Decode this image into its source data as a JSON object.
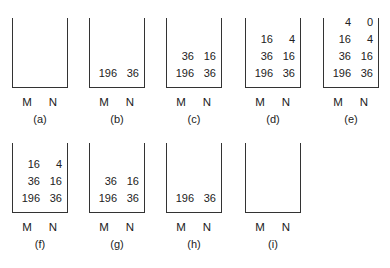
{
  "column_labels": {
    "m": "M",
    "n": "N"
  },
  "stacks": [
    {
      "caption": "(a)",
      "rows": []
    },
    {
      "caption": "(b)",
      "rows": [
        {
          "m": "196",
          "n": "36"
        }
      ]
    },
    {
      "caption": "(c)",
      "rows": [
        {
          "m": "196",
          "n": "36"
        },
        {
          "m": "36",
          "n": "16"
        }
      ]
    },
    {
      "caption": "(d)",
      "rows": [
        {
          "m": "196",
          "n": "36"
        },
        {
          "m": "36",
          "n": "16"
        },
        {
          "m": "16",
          "n": "4"
        }
      ]
    },
    {
      "caption": "(e)",
      "rows": [
        {
          "m": "196",
          "n": "36"
        },
        {
          "m": "36",
          "n": "16"
        },
        {
          "m": "16",
          "n": "4"
        },
        {
          "m": "4",
          "n": "0"
        }
      ]
    },
    {
      "caption": "(f)",
      "rows": [
        {
          "m": "196",
          "n": "36"
        },
        {
          "m": "36",
          "n": "16"
        },
        {
          "m": "16",
          "n": "4"
        }
      ]
    },
    {
      "caption": "(g)",
      "rows": [
        {
          "m": "196",
          "n": "36"
        },
        {
          "m": "36",
          "n": "16"
        }
      ]
    },
    {
      "caption": "(h)",
      "rows": [
        {
          "m": "196",
          "n": "36"
        }
      ]
    },
    {
      "caption": "(i)",
      "rows": []
    }
  ]
}
